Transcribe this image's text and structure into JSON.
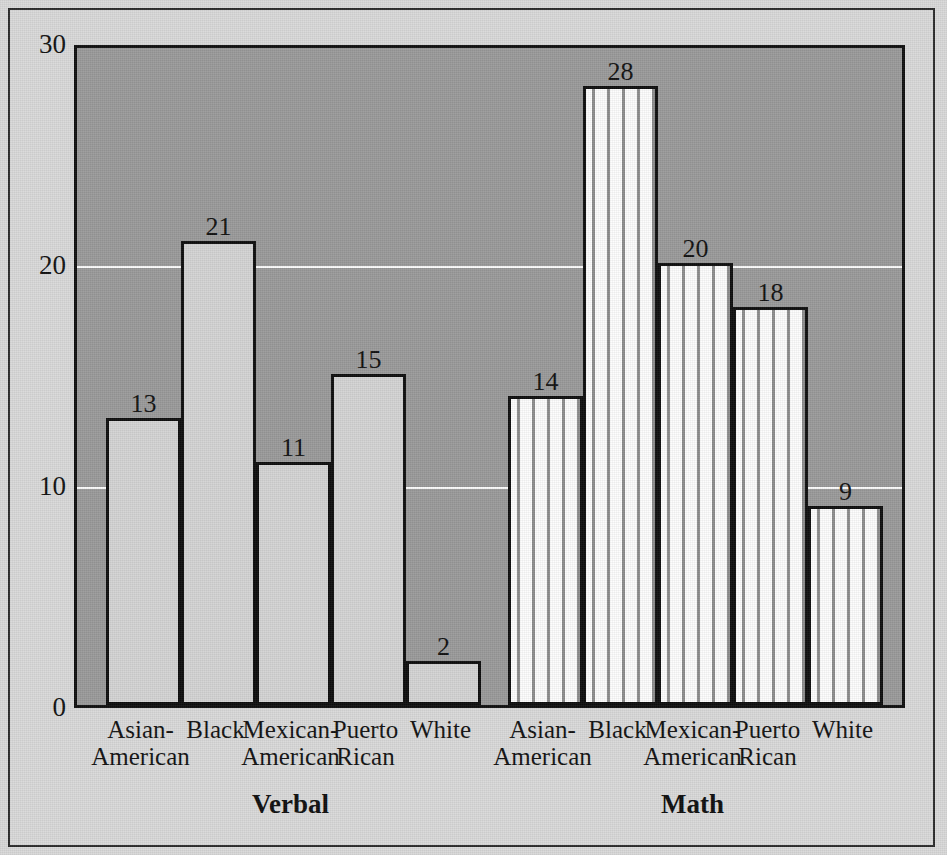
{
  "chart_data": {
    "type": "bar",
    "title": "",
    "xlabel": "",
    "ylabel": "",
    "ylim": [
      0,
      30
    ],
    "yticks": [
      0,
      10,
      20,
      30
    ],
    "ytick_labels": [
      "0",
      "10",
      "20",
      "30"
    ],
    "gridlines": [
      10,
      20
    ],
    "grid": true,
    "legend_position": "none",
    "groups": [
      {
        "name": "Verbal",
        "label": "Verbal",
        "fill": "solid-gray",
        "categories": [
          "Asian-\nAmerican",
          "Black",
          "Mexican-\nAmerican",
          "Puerto\nRican",
          "White"
        ],
        "values": [
          13,
          21,
          11,
          15,
          2
        ]
      },
      {
        "name": "Math",
        "label": "Math",
        "fill": "vertical-dashed-hatch",
        "categories": [
          "Asian-\nAmerican",
          "Black",
          "Mexican-\nAmerican",
          "Puerto\nRican",
          "White"
        ],
        "values": [
          14,
          28,
          20,
          18,
          9
        ]
      }
    ]
  },
  "axis": {
    "y_labels": [
      "30",
      "20",
      "10",
      "0"
    ]
  },
  "bars": [
    {
      "id": "verbal-asian-american",
      "group": "Verbal",
      "category_line1": "Asian-",
      "category_line2": "American",
      "value": 13,
      "value_label": "13",
      "fill": "solid"
    },
    {
      "id": "verbal-black",
      "group": "Verbal",
      "category_line1": "Black",
      "category_line2": "",
      "value": 21,
      "value_label": "21",
      "fill": "solid"
    },
    {
      "id": "verbal-mexican-american",
      "group": "Verbal",
      "category_line1": "Mexican-",
      "category_line2": "American",
      "value": 11,
      "value_label": "11",
      "fill": "solid"
    },
    {
      "id": "verbal-puerto-rican",
      "group": "Verbal",
      "category_line1": "Puerto",
      "category_line2": "Rican",
      "value": 15,
      "value_label": "15",
      "fill": "solid"
    },
    {
      "id": "verbal-white",
      "group": "Verbal",
      "category_line1": "White",
      "category_line2": "",
      "value": 2,
      "value_label": "2",
      "fill": "solid"
    },
    {
      "id": "math-asian-american",
      "group": "Math",
      "category_line1": "Asian-",
      "category_line2": "American",
      "value": 14,
      "value_label": "14",
      "fill": "hatch"
    },
    {
      "id": "math-black",
      "group": "Math",
      "category_line1": "Black",
      "category_line2": "",
      "value": 28,
      "value_label": "28",
      "fill": "hatch"
    },
    {
      "id": "math-mexican-american",
      "group": "Math",
      "category_line1": "Mexican-",
      "category_line2": "American",
      "value": 20,
      "value_label": "20",
      "fill": "hatch"
    },
    {
      "id": "math-puerto-rican",
      "group": "Math",
      "category_line1": "Puerto",
      "category_line2": "Rican",
      "value": 18,
      "value_label": "18",
      "fill": "hatch"
    },
    {
      "id": "math-white",
      "group": "Math",
      "category_line1": "White",
      "category_line2": "",
      "value": 9,
      "value_label": "9",
      "fill": "hatch"
    }
  ],
  "group_labels": [
    {
      "id": "group-label-verbal",
      "text": "Verbal"
    },
    {
      "id": "group-label-math",
      "text": "Math"
    }
  ],
  "colors": {
    "page_background": "#d9d9d9",
    "plot_background": "#9a9a9a",
    "bar_solid_fill": "#d4d4d4",
    "bar_hatch_fill": "#fdfdfd",
    "bar_outline": "#0d0d0d",
    "gridline": "#fdfdfd",
    "text": "#111111",
    "frame": "#2a2a2a"
  }
}
